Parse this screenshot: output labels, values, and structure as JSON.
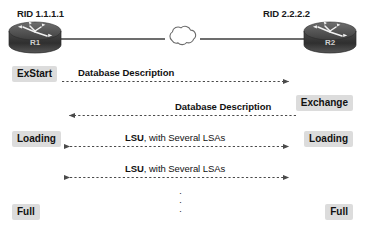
{
  "diagram": {
    "background_color": "#ffffff",
    "badge_color": "#dcdcdc",
    "line_color": "#555555",
    "router_color": "#4d4d4d"
  },
  "topology": {
    "left_router": {
      "rid_label": "RID 1.1.1.1",
      "name": "R1",
      "icon": "router-icon"
    },
    "right_router": {
      "rid_label": "RID 2.2.2.2",
      "name": "R2",
      "icon": "router-icon"
    },
    "cloud": {
      "icon": "network-cloud-icon"
    }
  },
  "states": {
    "left": [
      {
        "label": "ExStart"
      },
      {
        "label": "Loading"
      },
      {
        "label": "Full"
      }
    ],
    "right": [
      {
        "label": "Exchange"
      },
      {
        "label": "Loading"
      },
      {
        "label": "Full"
      }
    ]
  },
  "messages": [
    {
      "bold_text": "Database Description",
      "plain_text": "",
      "direction": "right"
    },
    {
      "bold_text": "Database Description",
      "plain_text": "",
      "direction": "left"
    },
    {
      "bold_text": "LSU",
      "plain_text": ", with Several LSAs",
      "direction": "both"
    },
    {
      "bold_text": "LSU",
      "plain_text": ", with Several LSAs",
      "direction": "both"
    }
  ],
  "ellipsis": {
    "dot": "·"
  }
}
